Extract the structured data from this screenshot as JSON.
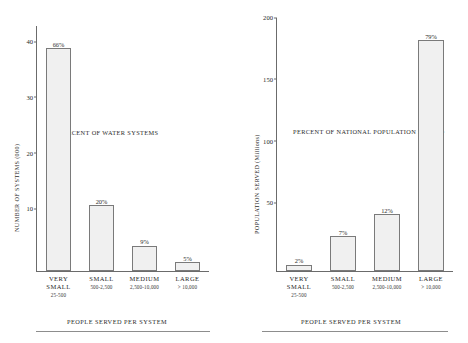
{
  "chart_data": [
    {
      "type": "bar",
      "title": "",
      "annotation": "PERCENT OF WATER SYSTEMS",
      "xlabel": "PEOPLE SERVED PER SYSTEM",
      "ylabel": "NUMBER OF SYSTEMS (000)",
      "ylim": [
        0,
        44
      ],
      "yticks": [
        10,
        20,
        30,
        40
      ],
      "ytick_labels": [
        "10",
        "20",
        "30",
        "40"
      ],
      "grid": false,
      "legend": "none",
      "categories": [
        "VERY SMALL",
        "SMALL",
        "MEDIUM",
        "LARGE"
      ],
      "category_sublabels": [
        "25-500",
        "500-2,500",
        "2,500-10,000",
        "> 10,000"
      ],
      "values": [
        40,
        11.8,
        4.5,
        1.6
      ],
      "data_labels": [
        "66%",
        "20%",
        "9%",
        "5%"
      ]
    },
    {
      "type": "bar",
      "title": "",
      "annotation": "PERCENT OF NATIONAL POPULATION SERVED",
      "xlabel": "PEOPLE SERVED PER SYSTEM",
      "ylabel": "POPULATION SERVED (Millions)",
      "ylim": [
        0,
        205
      ],
      "yticks": [
        50,
        100,
        150,
        200
      ],
      "ytick_labels": [
        "50",
        "100",
        "150",
        "200"
      ],
      "grid": false,
      "legend": "none",
      "categories": [
        "VERY SMALL",
        "SMALL",
        "MEDIUM",
        "LARGE"
      ],
      "category_sublabels": [
        "25-500",
        "500-2,500",
        "2,500-10,000",
        "> 10,000"
      ],
      "values": [
        5,
        28,
        46,
        187
      ],
      "data_labels": [
        "2%",
        "7%",
        "12%",
        "79%"
      ]
    }
  ],
  "style": {
    "bar_fill": "#f0f0f0",
    "bar_border": "#7a7a7a",
    "axis_color": "#6b6b6b",
    "text_color": "#2b2b2b",
    "background": "#ffffff"
  }
}
